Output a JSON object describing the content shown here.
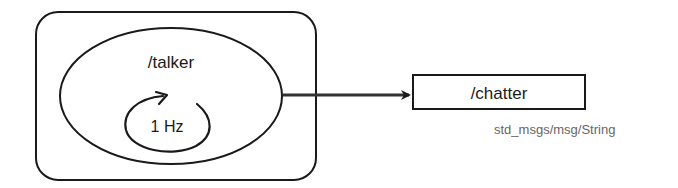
{
  "diagram": {
    "node": {
      "name": "/talker",
      "timer_label": "1 Hz",
      "timer_icon": "rotate-cw-arrow-icon"
    },
    "topic": {
      "name": "/chatter",
      "message_type": "std_msgs/msg/String"
    },
    "edge": {
      "from": "/talker",
      "to": "/chatter",
      "style": "arrow"
    },
    "colors": {
      "stroke": "#1a1a1a",
      "type_text": "#666666",
      "background": "#ffffff"
    }
  }
}
